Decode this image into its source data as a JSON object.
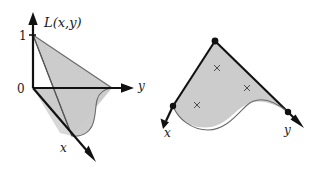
{
  "figure": {
    "title": "",
    "background_color": "#ffffff",
    "ink_color": "#111111",
    "region_fill_color": "#c9c9c9",
    "left_panel": {
      "name": "coordinate-diagram",
      "surface_label": "L(x,y)",
      "axis_labels": {
        "vertical_top_tick": "1",
        "origin": "0",
        "horizontal_axis": "y",
        "depth_axis": "x"
      },
      "axes": [
        {
          "id": "vertical-axis",
          "label": "",
          "direction": "up"
        },
        {
          "id": "y-axis",
          "label": "y",
          "direction": "right"
        },
        {
          "id": "x-axis",
          "label": "x",
          "direction": "down-right"
        }
      ],
      "tick_values": [
        "1",
        "0"
      ]
    },
    "right_panel": {
      "name": "abstract-region-diagram",
      "axis_labels": {
        "left_axis": "x",
        "right_axis": "y"
      },
      "vertices": [
        {
          "id": "apex-vertex",
          "label": ""
        },
        {
          "id": "left-vertex",
          "label": ""
        },
        {
          "id": "right-vertex",
          "label": ""
        }
      ],
      "interior_marks": [
        {
          "id": "cross-upper",
          "glyph": "x"
        },
        {
          "id": "cross-middle",
          "glyph": "x"
        },
        {
          "id": "cross-lower",
          "glyph": "x"
        }
      ],
      "mark_glyph": "×"
    }
  }
}
